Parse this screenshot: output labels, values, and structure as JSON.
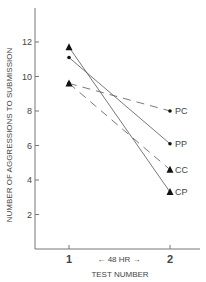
{
  "chart_data": {
    "type": "line",
    "title": "",
    "xlabel": "TEST NUMBER",
    "ylabel": "NUMBER OF AGGRESSIONS TO SUBMISSION",
    "x": [
      "1",
      "2"
    ],
    "x_annotation": "← 48 HR →",
    "ylim": [
      0,
      14
    ],
    "yticks": [
      2,
      4,
      6,
      8,
      10,
      12
    ],
    "grid": false,
    "legend_position": "inline-right",
    "series": [
      {
        "name": "PC",
        "values": [
          9.6,
          8.0
        ],
        "line": "dashed",
        "marker": "dot"
      },
      {
        "name": "PP",
        "values": [
          11.1,
          6.1
        ],
        "line": "solid",
        "marker": "dot"
      },
      {
        "name": "CC",
        "values": [
          9.6,
          4.6
        ],
        "line": "dashed",
        "marker": "triangle"
      },
      {
        "name": "CP",
        "values": [
          11.7,
          3.3
        ],
        "line": "solid",
        "marker": "triangle"
      }
    ]
  }
}
